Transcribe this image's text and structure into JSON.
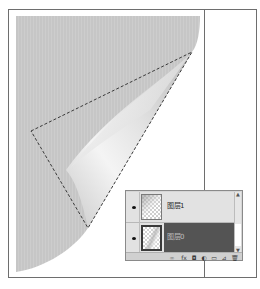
{
  "canvas": {
    "background": "#ffffff",
    "frame_border_color": "#6e6e6e",
    "paper_color": "#c8c8c8",
    "curl_highlight_color": "#f2f2f2",
    "selection": "marching-ants-dashed-polygon"
  },
  "layers_panel": {
    "layers": [
      {
        "name": "图层1",
        "visible": true,
        "selected": false,
        "visibility_icon": "eye-icon"
      },
      {
        "name": "图层0",
        "visible": true,
        "selected": true,
        "visibility_icon": "eye-icon"
      }
    ],
    "selected_color": "#545454",
    "scroll": {
      "up": "▲",
      "down": "▼"
    },
    "toolbar": {
      "icons": [
        {
          "name": "link-layers-icon",
          "glyph": "∞"
        },
        {
          "name": "layer-style-icon",
          "glyph": "fx"
        },
        {
          "name": "layer-mask-icon",
          "glyph": "◘"
        },
        {
          "name": "adjustment-layer-icon",
          "glyph": "◐"
        },
        {
          "name": "new-group-icon",
          "glyph": "▭"
        },
        {
          "name": "new-layer-icon",
          "glyph": "⊿"
        },
        {
          "name": "delete-layer-icon",
          "glyph": "🗑"
        }
      ]
    }
  }
}
